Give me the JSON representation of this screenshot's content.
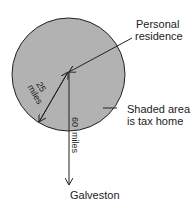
{
  "diagram": {
    "colors": {
      "shade": "#b2b2b2",
      "stroke": "#222222"
    },
    "labels": {
      "personal_line1": "Personal",
      "personal_line2": "residence",
      "shaded_line1": "Shaded area",
      "shaded_line2": "is tax home",
      "galveston": "Galveston",
      "radius_value": "25",
      "radius_unit": "miles",
      "distance_value": "60",
      "distance_unit": "miles"
    }
  }
}
